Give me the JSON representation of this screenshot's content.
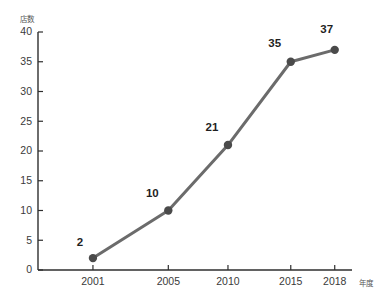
{
  "chart_data": {
    "type": "line",
    "title": "",
    "xlabel": "年度",
    "ylabel": "店数",
    "categories": [
      "2001",
      "2005",
      "2010",
      "2015",
      "2018"
    ],
    "values": [
      2,
      10,
      21,
      35,
      37
    ],
    "series": [
      {
        "name": "店数",
        "values": [
          2,
          10,
          21,
          35,
          37
        ]
      }
    ],
    "point_labels": [
      "2",
      "10",
      "21",
      "35",
      "37"
    ],
    "ylim": [
      0,
      40
    ],
    "ytick_labels": [
      "0",
      "5",
      "10",
      "15",
      "20",
      "25",
      "30",
      "35",
      "40"
    ],
    "ytick_values": [
      0,
      5,
      10,
      15,
      20,
      25,
      30,
      35,
      40
    ],
    "xtick_labels": [
      "2001",
      "2005",
      "2010",
      "2015",
      "2018"
    ],
    "grid": false,
    "legend": false,
    "legend_position": "none",
    "line_color": "#6b6b6b",
    "marker_color": "#4a4a4a",
    "axis_color": "#2e2e2e",
    "label_color": "#1f1f1f",
    "background": "#ffffff"
  }
}
